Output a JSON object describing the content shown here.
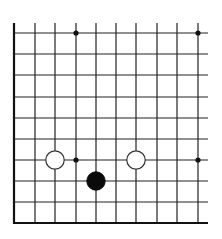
{
  "board": {
    "columns_x": [
      14,
      35,
      55,
      76,
      96,
      116,
      136,
      157,
      177,
      198
    ],
    "rows_y": [
      33,
      54,
      75,
      97,
      118,
      139,
      160,
      181,
      202,
      223
    ],
    "vertical_top_y": 23,
    "horizontal_right_x": 208,
    "left_edge_x": 14,
    "bottom_edge_y": 223,
    "line_color": "#222222",
    "edge_color": "#111111"
  },
  "star_points": [
    {
      "col": 3,
      "row": 0
    },
    {
      "col": 9,
      "row": 0
    },
    {
      "col": 3,
      "row": 6
    },
    {
      "col": 9,
      "row": 6
    }
  ],
  "stones": [
    {
      "color": "white",
      "col": 2,
      "row": 6
    },
    {
      "color": "white",
      "col": 6,
      "row": 6
    },
    {
      "color": "black",
      "col": 4,
      "row": 7
    }
  ]
}
